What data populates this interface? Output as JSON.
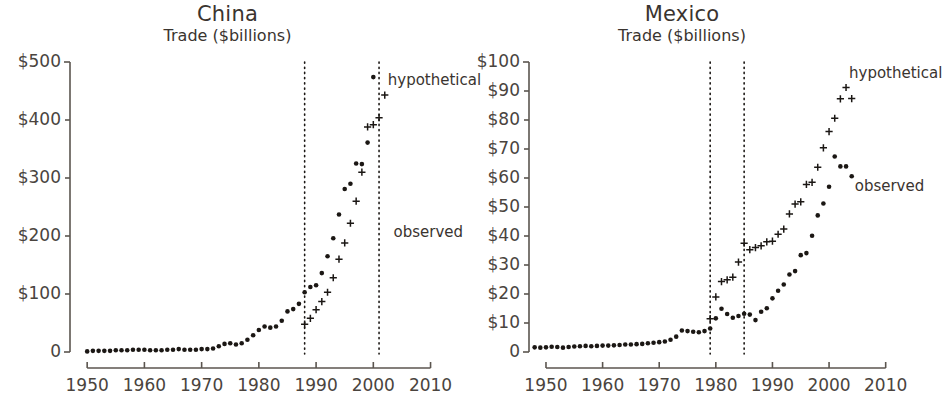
{
  "figure": {
    "panels": [
      {
        "id": "china",
        "title": "China",
        "subtitle": "Trade ($billions)",
        "annotation_hypothetical": "hypothetical",
        "annotation_observed": "observed"
      },
      {
        "id": "mexico",
        "title": "Mexico",
        "subtitle": "Trade ($billions)",
        "annotation_hypothetical": "hypothetical",
        "annotation_observed": "observed"
      }
    ]
  },
  "chart_data": [
    {
      "type": "scatter",
      "title": "China",
      "subtitle": "Trade ($billions)",
      "xlabel": "",
      "ylabel": "Trade ($billions)",
      "xlim": [
        1947,
        2012
      ],
      "ylim": [
        0,
        500
      ],
      "xticks": [
        1950,
        1960,
        1970,
        1980,
        1990,
        2000,
        2010
      ],
      "xticklabels": [
        "1950",
        "1960",
        "1970",
        "1980",
        "1990",
        "2000",
        "2010"
      ],
      "yticks": [
        0,
        100,
        200,
        300,
        400,
        500
      ],
      "yticklabels": [
        "0",
        "$100",
        "$200",
        "$300",
        "$400",
        "$500"
      ],
      "grid": false,
      "legend": "annotations",
      "annotations": [
        {
          "text": "hypothetical",
          "x": 2002,
          "y": 468
        },
        {
          "text": "observed",
          "x": 2003,
          "y": 205
        }
      ],
      "vlines": [
        {
          "x": 1988,
          "style": "dotted",
          "label": "accession year"
        },
        {
          "x": 2001,
          "style": "dotted",
          "label": "end of sample"
        }
      ],
      "series": [
        {
          "name": "observed",
          "marker": "filled-circle",
          "x": [
            1950,
            1951,
            1952,
            1953,
            1954,
            1955,
            1956,
            1957,
            1958,
            1959,
            1960,
            1961,
            1962,
            1963,
            1964,
            1965,
            1966,
            1967,
            1968,
            1969,
            1970,
            1971,
            1972,
            1973,
            1974,
            1975,
            1976,
            1977,
            1978,
            1979,
            1980,
            1981,
            1982,
            1983,
            1984,
            1985,
            1986,
            1987,
            1988,
            1989,
            1990,
            1991,
            1992,
            1993,
            1994,
            1995,
            1996,
            1997,
            1998,
            1999,
            2000,
            2001,
            2002,
            2003
          ],
          "y": [
            1.2,
            1.9,
            1.9,
            2.4,
            2.4,
            3.1,
            3.2,
            3.1,
            3.8,
            4.3,
            3.8,
            3.0,
            2.7,
            2.9,
            3.5,
            4.3,
            4.6,
            4.2,
            4.0,
            4.1,
            4.6,
            4.8,
            6.3,
            10.0,
            14.2,
            14.7,
            13.4,
            14.8,
            20.6,
            29.3,
            38.1,
            44.0,
            41.6,
            43.6,
            53.6,
            69.6,
            73.8,
            82.7,
            102.8,
            111.7,
            115.4,
            135.6,
            165.5,
            195.7,
            236.6,
            280.9,
            289.9,
            325.2,
            323.9,
            360.6,
            474.3,
            509.8,
            620.8,
            851.0
          ],
          "y_plotted": [
            1,
            2,
            2,
            2,
            2,
            3,
            3,
            3,
            4,
            4,
            4,
            3,
            3,
            3,
            4,
            4,
            5,
            4,
            4,
            4,
            5,
            5,
            6,
            10,
            14,
            15,
            13,
            15,
            21,
            29,
            38,
            44,
            42,
            44,
            54,
            70,
            74,
            83,
            103,
            112,
            115,
            136,
            165,
            196,
            237,
            281,
            290,
            325,
            324,
            361,
            474,
            510,
            621,
            851
          ]
        },
        {
          "name": "hypothetical",
          "marker": "plus",
          "x": [
            1988,
            1989,
            1990,
            1991,
            1992,
            1993,
            1994,
            1995,
            1996,
            1997,
            1998,
            1999,
            2000,
            2001,
            2002
          ],
          "y": [
            48,
            58,
            73,
            87,
            103,
            128,
            160,
            188,
            222,
            260,
            310,
            388,
            392,
            404,
            443
          ]
        }
      ]
    },
    {
      "type": "scatter",
      "title": "Mexico",
      "subtitle": "Trade ($billions)",
      "xlabel": "",
      "ylabel": "Trade ($billions)",
      "xlim": [
        1947,
        2012
      ],
      "ylim": [
        0,
        100
      ],
      "xticks": [
        1950,
        1960,
        1970,
        1980,
        1990,
        2000,
        2010
      ],
      "xticklabels": [
        "1950",
        "1960",
        "1970",
        "1980",
        "1990",
        "2000",
        "2010"
      ],
      "yticks": [
        0,
        10,
        20,
        30,
        40,
        50,
        60,
        70,
        80,
        90,
        100
      ],
      "yticklabels": [
        "0",
        "$10",
        "$20",
        "$30",
        "$40",
        "$50",
        "$60",
        "$70",
        "$80",
        "$90",
        "$100"
      ],
      "grid": false,
      "legend": "annotations",
      "annotations": [
        {
          "text": "hypothetical",
          "x": 2003,
          "y": 96
        },
        {
          "text": "observed",
          "x": 2004,
          "y": 57
        }
      ],
      "vlines": [
        {
          "x": 1979,
          "style": "dotted",
          "label": "accession year"
        },
        {
          "x": 1985,
          "style": "dotted",
          "label": "end of sample"
        }
      ],
      "series": [
        {
          "name": "observed",
          "marker": "filled-circle",
          "x": [
            1948,
            1949,
            1950,
            1951,
            1952,
            1953,
            1954,
            1955,
            1956,
            1957,
            1958,
            1959,
            1960,
            1961,
            1962,
            1963,
            1964,
            1965,
            1966,
            1967,
            1968,
            1969,
            1970,
            1971,
            1972,
            1973,
            1974,
            1975,
            1976,
            1977,
            1978,
            1979,
            1980,
            1981,
            1982,
            1983,
            1984,
            1985,
            1986,
            1987,
            1988,
            1989,
            1990,
            1991,
            1992,
            1993,
            1994,
            1995,
            1996,
            1997,
            1998,
            1999,
            2000,
            2001,
            2002,
            2003,
            2004
          ],
          "y": [
            1.6,
            1.5,
            1.6,
            1.8,
            1.7,
            1.5,
            1.7,
            1.9,
            2.0,
            2.1,
            2.0,
            2.1,
            2.2,
            2.2,
            2.3,
            2.4,
            2.6,
            2.6,
            2.7,
            2.8,
            3.0,
            3.2,
            3.4,
            3.6,
            4.2,
            5.3,
            7.4,
            7.2,
            7.0,
            6.8,
            7.2,
            8.1,
            11.6,
            14.9,
            13.1,
            11.8,
            12.4,
            13.2,
            12.9,
            11.0,
            13.9,
            15.1,
            18.5,
            21.1,
            23.3,
            26.7,
            27.9,
            33.4,
            34.1,
            40.1,
            47.1,
            51.2,
            57.0,
            67.4,
            64.0,
            64.0,
            60.6
          ]
        },
        {
          "name": "hypothetical",
          "marker": "plus",
          "x": [
            1979,
            1980,
            1981,
            1982,
            1983,
            1984,
            1985,
            1986,
            1987,
            1988,
            1989,
            1990,
            1991,
            1992,
            1993,
            1994,
            1995,
            1996,
            1997,
            1998,
            1999,
            2000,
            2001,
            2002,
            2003,
            2004
          ],
          "y": [
            11.5,
            19.0,
            24.3,
            24.9,
            25.8,
            31.0,
            37.5,
            35.3,
            36.0,
            36.6,
            38.0,
            38.2,
            40.6,
            42.4,
            47.6,
            51.0,
            51.8,
            57.8,
            58.5,
            63.7,
            70.4,
            76.0,
            80.6,
            87.3,
            91.2,
            87.4
          ]
        }
      ]
    }
  ]
}
